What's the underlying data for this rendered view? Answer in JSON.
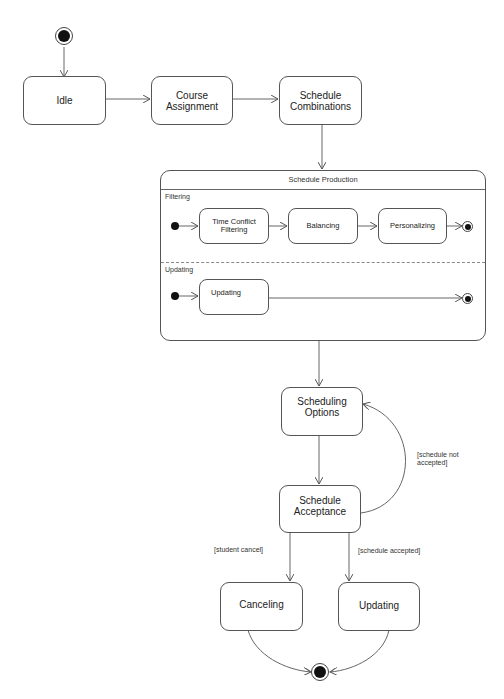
{
  "diagram": {
    "type": "uml-state-machine",
    "states": {
      "idle": "Idle",
      "course_assignment": "Course Assignment",
      "schedule_combinations": "Schedule Combinations",
      "scheduling_options": "Scheduling Options",
      "schedule_acceptance": "Schedule Acceptance",
      "canceling": "Canceling",
      "updating": "Updating"
    },
    "composite": {
      "title": "Schedule Production",
      "regions": [
        {
          "name": "Filtering",
          "states": [
            "Time Conflict Filtering",
            "Balancing",
            "Personalizing"
          ]
        },
        {
          "name": "Updating",
          "states": [
            "Updating"
          ]
        }
      ]
    },
    "guards": {
      "not_accepted": "[schedule not accepted]",
      "student_cancel": "[student cancel]",
      "accepted": "[schedule accepted]"
    }
  }
}
